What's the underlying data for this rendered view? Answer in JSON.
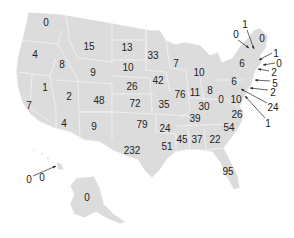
{
  "map": {
    "title": "",
    "region": "United States",
    "colors": {
      "land": "#dcdcdc",
      "borders": "#ffffff",
      "text": "#222222",
      "background": "#ffffff"
    },
    "labels": [
      {
        "value": "0",
        "x": 46,
        "y": 23
      },
      {
        "value": "15",
        "x": 89,
        "y": 47
      },
      {
        "value": "13",
        "x": 127,
        "y": 48
      },
      {
        "value": "33",
        "x": 153,
        "y": 56
      },
      {
        "value": "4",
        "x": 35,
        "y": 55
      },
      {
        "value": "8",
        "x": 62,
        "y": 65
      },
      {
        "value": "9",
        "x": 93,
        "y": 73
      },
      {
        "value": "10",
        "x": 128,
        "y": 68
      },
      {
        "value": "7",
        "x": 176,
        "y": 64
      },
      {
        "value": "1",
        "x": 45,
        "y": 88
      },
      {
        "value": "26",
        "x": 132,
        "y": 87
      },
      {
        "value": "42",
        "x": 158,
        "y": 81
      },
      {
        "value": "10",
        "x": 199,
        "y": 73
      },
      {
        "value": "2",
        "x": 69,
        "y": 97
      },
      {
        "value": "48",
        "x": 99,
        "y": 101
      },
      {
        "value": "72",
        "x": 135,
        "y": 104
      },
      {
        "value": "76",
        "x": 180,
        "y": 95
      },
      {
        "value": "11",
        "x": 195,
        "y": 93
      },
      {
        "value": "8",
        "x": 210,
        "y": 91
      },
      {
        "value": "7",
        "x": 29,
        "y": 106
      },
      {
        "value": "35",
        "x": 164,
        "y": 105
      },
      {
        "value": "0",
        "x": 221,
        "y": 100
      },
      {
        "value": "10",
        "x": 236,
        "y": 100
      },
      {
        "value": "30",
        "x": 204,
        "y": 107
      },
      {
        "value": "4",
        "x": 64,
        "y": 124
      },
      {
        "value": "9",
        "x": 94,
        "y": 127
      },
      {
        "value": "79",
        "x": 142,
        "y": 125
      },
      {
        "value": "39",
        "x": 195,
        "y": 119
      },
      {
        "value": "26",
        "x": 237,
        "y": 115
      },
      {
        "value": "24",
        "x": 165,
        "y": 129
      },
      {
        "value": "54",
        "x": 229,
        "y": 128
      },
      {
        "value": "45",
        "x": 182,
        "y": 140
      },
      {
        "value": "37",
        "x": 197,
        "y": 140
      },
      {
        "value": "22",
        "x": 215,
        "y": 140
      },
      {
        "value": "232",
        "x": 132,
        "y": 151
      },
      {
        "value": "51",
        "x": 167,
        "y": 147
      },
      {
        "value": "95",
        "x": 228,
        "y": 172
      },
      {
        "value": "0",
        "x": 87,
        "y": 198
      },
      {
        "value": "0",
        "x": 42,
        "y": 178
      },
      {
        "value": "0",
        "x": 262,
        "y": 39
      },
      {
        "value": "6",
        "x": 242,
        "y": 64
      },
      {
        "value": "6",
        "x": 234,
        "y": 82
      }
    ],
    "callouts": [
      {
        "value": "1",
        "x": 245,
        "y": 25,
        "x1": 247,
        "y1": 30,
        "x2": 254,
        "y2": 49
      },
      {
        "value": "0",
        "x": 236,
        "y": 35,
        "x1": 238,
        "y1": 40,
        "x2": 249,
        "y2": 48
      },
      {
        "value": "1",
        "x": 276,
        "y": 54,
        "x1": 272,
        "y1": 53,
        "x2": 259,
        "y2": 60
      },
      {
        "value": "0",
        "x": 279,
        "y": 64,
        "x1": 275,
        "y1": 63,
        "x2": 263,
        "y2": 65
      },
      {
        "value": "2",
        "x": 274,
        "y": 73,
        "x1": 269,
        "y1": 71,
        "x2": 258,
        "y2": 69
      },
      {
        "value": "5",
        "x": 275,
        "y": 84,
        "x1": 270,
        "y1": 81,
        "x2": 255,
        "y2": 80
      },
      {
        "value": "2",
        "x": 273,
        "y": 93,
        "x1": 268,
        "y1": 90,
        "x2": 250,
        "y2": 88
      },
      {
        "value": "24",
        "x": 273,
        "y": 108,
        "x1": 267,
        "y1": 103,
        "x2": 241,
        "y2": 89
      },
      {
        "value": "1",
        "x": 268,
        "y": 124,
        "x1": 265,
        "y1": 118,
        "x2": 245,
        "y2": 96
      },
      {
        "value": "0",
        "x": 29,
        "y": 180,
        "x1": 33,
        "y1": 176,
        "x2": 56,
        "y2": 166
      }
    ]
  }
}
